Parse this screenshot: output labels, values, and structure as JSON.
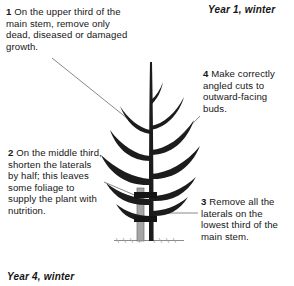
{
  "figure": {
    "title_top_right": "Year 1, winter",
    "title_bottom_left": "Year 4, winter"
  },
  "callouts": [
    {
      "id": "callout-1",
      "number": "1",
      "text": "1 On the upper third of the main stem, remove only dead, diseased or damaged growth."
    },
    {
      "id": "callout-2",
      "number": "2",
      "text": "2 On the middle third, shorten the laterals by half; this leaves some foliage to supply the plant with nutrition."
    },
    {
      "id": "callout-3",
      "number": "3",
      "text": "3 Remove all the laterals on the lowest third of the main stem."
    },
    {
      "id": "callout-4",
      "number": "4",
      "text": "4 Make correctly angled cuts to outward-facing buds."
    }
  ],
  "colors": {
    "background": "#ffffff",
    "text": "#161616",
    "plant": "#1c1c1c",
    "stake": "#9a9a9a",
    "tie": "#151515",
    "leader_line": "#6a6a6a",
    "ground": "#8c8c8c"
  }
}
